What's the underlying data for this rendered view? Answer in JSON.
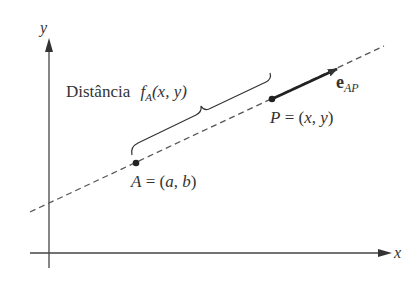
{
  "diagram": {
    "axes": {
      "x_label": "x",
      "y_label": "y"
    },
    "distance_label": {
      "prefix": "Distância",
      "func": "f",
      "func_sub": "A",
      "args": "(x, y)"
    },
    "point_A": {
      "name": "A",
      "eq": " = (",
      "coords_a": "a",
      "comma": ", ",
      "coords_b": "b",
      "close": ")"
    },
    "point_P": {
      "name": "P",
      "eq": " = (",
      "coords_x": "x",
      "comma": ", ",
      "coords_y": "y",
      "close": ")"
    },
    "vector": {
      "name": "e",
      "sub": "AP"
    },
    "colors": {
      "ink": "#333333",
      "background": "#ffffff"
    }
  }
}
